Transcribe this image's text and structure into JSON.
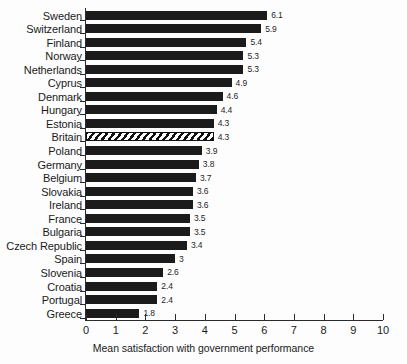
{
  "chart_data": {
    "type": "bar",
    "orientation": "horizontal",
    "title": "",
    "xlabel": "Mean satisfaction with government performance",
    "ylabel": "",
    "xlim": [
      0,
      10
    ],
    "xticks": [
      0,
      1,
      2,
      3,
      4,
      5,
      6,
      7,
      8,
      9,
      10
    ],
    "grid": false,
    "legend": null,
    "categories": [
      "Sweden",
      "Switzerland",
      "Finland",
      "Norway",
      "Netherlands",
      "Cyprus",
      "Denmark",
      "Hungary",
      "Estonia",
      "Britain",
      "Poland",
      "Germany",
      "Belgium",
      "Slovakia",
      "Ireland",
      "France",
      "Bulgaria",
      "Czech Republic",
      "Spain",
      "Slovenia",
      "Croatia",
      "Portugal",
      "Greece"
    ],
    "values": [
      6.1,
      5.9,
      5.4,
      5.3,
      5.3,
      4.9,
      4.6,
      4.4,
      4.3,
      4.3,
      3.9,
      3.8,
      3.7,
      3.6,
      3.6,
      3.5,
      3.5,
      3.4,
      3,
      2.6,
      2.4,
      2.4,
      1.8
    ],
    "value_labels": [
      "6.1",
      "5.9",
      "5.4",
      "5.3",
      "5.3",
      "4.9",
      "4.6",
      "4.4",
      "4.3",
      "4.3",
      "3.9",
      "3.8",
      "3.7",
      "3.6",
      "3.6",
      "3.5",
      "3.5",
      "3.4",
      "3",
      "2.6",
      "2.4",
      "2.4",
      "1.8"
    ],
    "highlighted_category": "Britain",
    "bar_fill_color": "#1b1b1b",
    "highlight_fill_pattern": "diagonal-hatch-white",
    "axis_color": "#2b2b2b"
  }
}
